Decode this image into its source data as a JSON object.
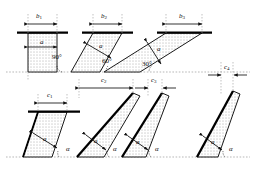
{
  "figure": {
    "colors": {
      "outline": "#1a1a1a",
      "fill_pattern_dot": "#4d4d4d",
      "fill_background": "#ffffff",
      "thick_edge": "#000000",
      "dotted_guide": "#8a8a8a"
    },
    "top_row": {
      "panels": [
        {
          "id": "panel-1",
          "width_label": "b",
          "width_sub": "1",
          "thickness_label": "a",
          "angle_label": "90°",
          "angle_value": 90
        },
        {
          "id": "panel-2",
          "width_label": "b",
          "width_sub": "2",
          "thickness_label": "a",
          "angle_label": "60°",
          "angle_value": 60
        },
        {
          "id": "panel-3",
          "width_label": "b",
          "width_sub": "3",
          "thickness_label": "a",
          "angle_label": "30°",
          "angle_value": 30
        }
      ]
    },
    "bottom_row": {
      "panels": [
        {
          "id": "panel-4",
          "width_label": "c",
          "width_sub": "1",
          "thickness_label": "a",
          "angle_label": "α"
        },
        {
          "id": "panel-5",
          "width_label": "c",
          "width_sub": "2",
          "thickness_label": "a",
          "angle_label": "α"
        },
        {
          "id": "panel-6",
          "width_label": "c",
          "width_sub": "3",
          "thickness_label": "a",
          "angle_label": "α"
        },
        {
          "id": "panel-7",
          "width_label": "c",
          "width_sub": "4",
          "thickness_label": "a",
          "angle_label": "α"
        }
      ]
    }
  }
}
